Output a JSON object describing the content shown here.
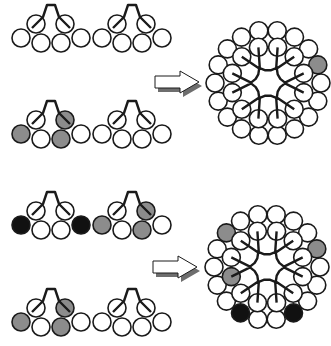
{
  "colors": {
    "background": "#ffffff",
    "stroke": "#1a1a1a",
    "white": "#ffffff",
    "gray": "#8c8c8c",
    "black": "#111111",
    "arrow_shadow": "#6e6e6e"
  },
  "unit_geometry": {
    "radius": 9,
    "top": [
      [
        -15,
        19
      ],
      [
        14,
        19
      ]
    ],
    "bottom": [
      [
        -30,
        33
      ],
      [
        -10,
        38
      ],
      [
        10,
        38
      ],
      [
        30,
        33
      ]
    ]
  },
  "small_units": [
    {
      "cx": 51,
      "cy": 5,
      "fills": {
        "top": [
          "white",
          "white"
        ],
        "bottom": [
          "white",
          "white",
          "white",
          "white"
        ]
      }
    },
    {
      "cx": 132,
      "cy": 5,
      "fills": {
        "top": [
          "white",
          "white"
        ],
        "bottom": [
          "white",
          "white",
          "white",
          "white"
        ]
      }
    },
    {
      "cx": 51,
      "cy": 101,
      "fills": {
        "top": [
          "white",
          "gray"
        ],
        "bottom": [
          "gray",
          "white",
          "gray",
          "white"
        ]
      }
    },
    {
      "cx": 132,
      "cy": 101,
      "fills": {
        "top": [
          "white",
          "white"
        ],
        "bottom": [
          "white",
          "white",
          "white",
          "white"
        ]
      }
    },
    {
      "cx": 51,
      "cy": 192,
      "fills": {
        "top": [
          "white",
          "white"
        ],
        "bottom": [
          "black",
          "white",
          "white",
          "black"
        ]
      }
    },
    {
      "cx": 132,
      "cy": 192,
      "fills": {
        "top": [
          "white",
          "gray"
        ],
        "bottom": [
          "gray",
          "white",
          "gray",
          "white"
        ]
      }
    },
    {
      "cx": 51,
      "cy": 289,
      "fills": {
        "top": [
          "white",
          "gray"
        ],
        "bottom": [
          "gray",
          "white",
          "gray",
          "white"
        ]
      }
    },
    {
      "cx": 132,
      "cy": 289,
      "fills": {
        "top": [
          "white",
          "white"
        ],
        "bottom": [
          "white",
          "white",
          "white",
          "white"
        ]
      }
    }
  ],
  "arrows": [
    {
      "x": 155,
      "y": 71,
      "label": "assembly-arrow-top"
    },
    {
      "x": 153,
      "y": 256,
      "label": "assembly-arrow-bottom"
    }
  ],
  "clusters": [
    {
      "cx": 268,
      "cy": 83,
      "inner_radius": 37,
      "outer_radius": 53,
      "gray_circles": [
        [
          296,
          65
        ],
        [
          315,
          67
        ],
        [
          311,
          107
        ]
      ],
      "black_circles": []
    },
    {
      "cx": 267,
      "cy": 267,
      "inner_radius": 37,
      "outer_radius": 53,
      "gray_circles": [
        [
          297,
          251
        ],
        [
          315,
          253
        ],
        [
          311,
          293
        ],
        [
          223,
          237
        ],
        [
          219,
          274
        ],
        [
          237,
          277
        ]
      ],
      "black_circles": [
        [
          240,
          310
        ],
        [
          295,
          310
        ]
      ]
    }
  ]
}
